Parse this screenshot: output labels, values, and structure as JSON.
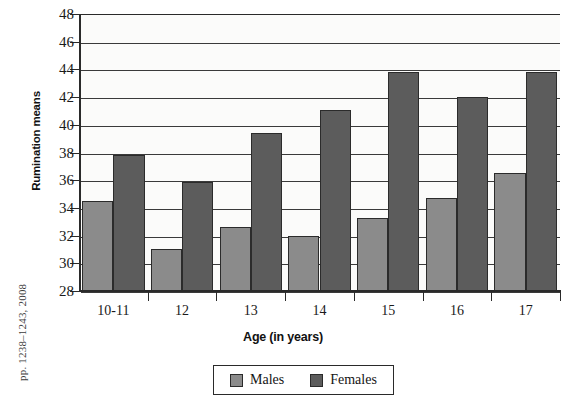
{
  "figure": {
    "side_citation": "pp. 1238–1243, 2008"
  },
  "chart_data": {
    "type": "bar",
    "title": "",
    "xlabel": "Age (in years)",
    "ylabel": "Rumination means",
    "categories": [
      "10-11",
      "12",
      "13",
      "14",
      "15",
      "16",
      "17"
    ],
    "series": [
      {
        "name": "Males",
        "color": "#8b8b8b",
        "values": [
          34.5,
          31.0,
          32.6,
          32.0,
          33.3,
          34.7,
          36.5
        ]
      },
      {
        "name": "Females",
        "color": "#5c5c5c",
        "values": [
          37.8,
          35.9,
          39.4,
          41.1,
          43.8,
          42.0,
          43.8
        ]
      }
    ],
    "ylim": [
      28,
      48
    ],
    "ytick_values": [
      28,
      30,
      32,
      34,
      36,
      38,
      40,
      42,
      44,
      46,
      48
    ],
    "ytick_labels": [
      "28",
      "30",
      "32",
      "34",
      "36",
      "38",
      "40",
      "42",
      "44",
      "46",
      "48"
    ],
    "grid": true,
    "legend_position": "bottom-center"
  }
}
